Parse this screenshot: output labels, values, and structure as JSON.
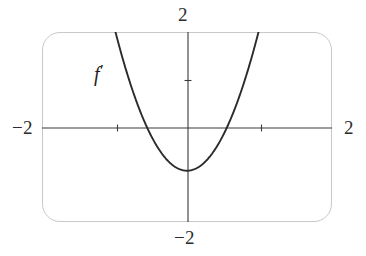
{
  "figure": {
    "kind": "cartesian-plot",
    "background_color": "#ffffff",
    "frame_color": "#c9c9c9",
    "axis_color": "#3a3a3a",
    "curve_color": "#2b2b2b"
  },
  "labels": {
    "x_min": "−2",
    "x_max": "2",
    "y_max": "2",
    "y_min": "−2",
    "curve_name": "f",
    "curve_prime": "′"
  },
  "chart_data": {
    "type": "line",
    "title": "",
    "xlabel": "",
    "ylabel": "",
    "xlim": [
      -2,
      2
    ],
    "ylim": [
      -2,
      2
    ],
    "grid": false,
    "legend": "none",
    "axes": {
      "x_axis_at_y": 0,
      "y_axis_at_x": 0,
      "x_tick_values": [
        -1,
        1
      ],
      "y_tick_values": [
        1
      ],
      "x_tick_labels": [
        "−2",
        "2"
      ],
      "y_tick_labels": [
        "−2",
        "2"
      ],
      "x_end_labels_at": [
        -2,
        2
      ],
      "y_end_labels_at": [
        -2,
        2
      ]
    },
    "annotations": [
      {
        "text": "f′",
        "x": -1.3,
        "y": 1.35,
        "style": "italic"
      }
    ],
    "series": [
      {
        "name": "f′",
        "equation": "y = 3x^2 - 0.92",
        "description": "upward-opening parabola, vertex below the x-axis",
        "vertex": [
          0,
          -0.92
        ],
        "roots": [
          -0.56,
          0.56
        ],
        "x": [
          -1.0,
          -0.9,
          -0.8,
          -0.7,
          -0.6,
          -0.5,
          -0.4,
          -0.3,
          -0.2,
          -0.1,
          0.0,
          0.1,
          0.2,
          0.3,
          0.4,
          0.5,
          0.6,
          0.7,
          0.8,
          0.9,
          1.0
        ],
        "values": [
          2.08,
          1.51,
          1.0,
          0.55,
          0.16,
          -0.17,
          -0.44,
          -0.65,
          -0.8,
          -0.89,
          -0.92,
          -0.89,
          -0.8,
          -0.65,
          -0.44,
          -0.17,
          0.16,
          0.55,
          1.0,
          1.51,
          2.08
        ]
      }
    ]
  }
}
